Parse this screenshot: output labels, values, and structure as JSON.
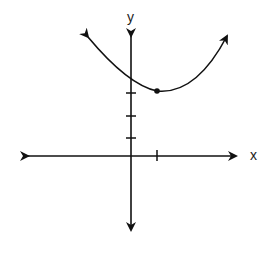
{
  "graph": {
    "type": "parabola",
    "x_axis_label": "x",
    "y_axis_label": "y",
    "vertex": {
      "x": 1,
      "y": 3
    },
    "y_ticks": [
      1,
      2,
      3
    ],
    "x_ticks": [
      1
    ],
    "opens": "up",
    "colors": {
      "line": "#111111",
      "background": "#ffffff"
    }
  }
}
